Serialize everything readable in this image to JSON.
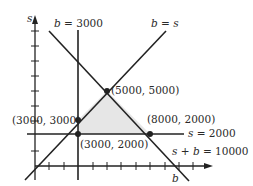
{
  "diagram": {
    "type": "linear-programming-feasible-region",
    "axes": {
      "x_label": "b",
      "y_label": "s"
    },
    "lines": [
      {
        "id": "b3000",
        "label": "b = 3000"
      },
      {
        "id": "bs",
        "label": "b = s"
      },
      {
        "id": "s2000",
        "label": "s = 2000"
      },
      {
        "id": "sb10000",
        "label": "s + b = 10000"
      }
    ],
    "points": [
      {
        "label": "(5000, 5000)"
      },
      {
        "label": "(3000, 3000)"
      },
      {
        "label": "(3000, 2000)"
      },
      {
        "label": "(8000, 2000)"
      }
    ],
    "region_fill": "#e6e6e6",
    "line_color": "#222222"
  }
}
